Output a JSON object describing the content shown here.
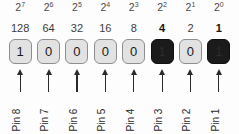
{
  "diagram": {
    "colors": {
      "background": "#fdfdfd",
      "box_off_fill": "#e2e2e2",
      "box_off_border": "#8e8e8e",
      "box_on_fill": "#1b1b1b",
      "box_on_border": "#101010",
      "text": "#2b2b2b",
      "arrow": "#2a2a2a"
    },
    "columns": [
      {
        "exponent_base": "2",
        "exponent_power": "7",
        "decimal": "128",
        "bit": "1",
        "active": false,
        "pin": "Pin 8"
      },
      {
        "exponent_base": "2",
        "exponent_power": "6",
        "decimal": "64",
        "bit": "0",
        "active": false,
        "pin": "Pin 7"
      },
      {
        "exponent_base": "2",
        "exponent_power": "5",
        "decimal": "32",
        "bit": "0",
        "active": false,
        "pin": "Pin 6"
      },
      {
        "exponent_base": "2",
        "exponent_power": "4",
        "decimal": "16",
        "bit": "0",
        "active": false,
        "pin": "Pin 5"
      },
      {
        "exponent_base": "2",
        "exponent_power": "3",
        "decimal": "8",
        "bit": "0",
        "active": false,
        "pin": "Pin 4"
      },
      {
        "exponent_base": "2",
        "exponent_power": "2",
        "decimal": "4",
        "bit": "1",
        "active": true,
        "pin": "Pin 3"
      },
      {
        "exponent_base": "2",
        "exponent_power": "1",
        "decimal": "2",
        "bit": "0",
        "active": false,
        "pin": "Pin 2"
      },
      {
        "exponent_base": "2",
        "exponent_power": "0",
        "decimal": "1",
        "bit": "1",
        "active": true,
        "pin": "Pin 1"
      }
    ]
  }
}
